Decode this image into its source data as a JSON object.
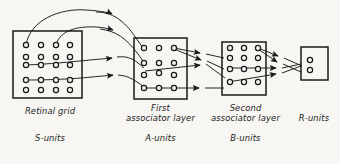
{
  "figure": {
    "type": "neural-network-architecture-diagram",
    "background_color": "#f7f6f3",
    "ink_color": "#1a1a1a",
    "layers": [
      {
        "id": "retinal-grid",
        "title": "Retinal grid",
        "unit_label": "S-units",
        "rows": 5,
        "cols": 4,
        "unit_count": 20,
        "box": {
          "x": 13,
          "y": 31,
          "w": 69,
          "h": 67
        }
      },
      {
        "id": "first-associator-layer",
        "title_line1": "First",
        "title_line2": "associator layer",
        "unit_label": "A-units",
        "rows": 4,
        "cols": 3,
        "unit_count": 12,
        "box": {
          "x": 134,
          "y": 38,
          "w": 53,
          "h": 61
        }
      },
      {
        "id": "second-associator-layer",
        "title_line1": "Second",
        "title_line2": "associator layer",
        "unit_label": "B-units",
        "rows": 4,
        "cols": 3,
        "unit_count": 12,
        "box": {
          "x": 222,
          "y": 42,
          "w": 44,
          "h": 53
        }
      },
      {
        "id": "r-units",
        "title": "R-units",
        "unit_label": "",
        "rows": 2,
        "cols": 1,
        "unit_count": 2,
        "box": {
          "x": 301,
          "y": 47,
          "w": 27,
          "h": 33
        }
      }
    ],
    "connection_groups": [
      {
        "from": "retinal-grid",
        "to": "first-associator-layer",
        "style": "curved-arc-and-straight",
        "count": 4
      },
      {
        "from": "first-associator-layer",
        "to": "second-associator-layer",
        "style": "crossing-straight",
        "count": 4
      },
      {
        "from": "second-associator-layer",
        "to": "r-units",
        "style": "converging-crossing",
        "count": 4
      }
    ],
    "arrow_marker": "filled-triangle"
  },
  "labels": {
    "retinal_grid_title": "Retinal grid",
    "s_units": "S-units",
    "first_assoc_line1": "First",
    "first_assoc_line2": "associator layer",
    "a_units": "A-units",
    "second_assoc_line1": "Second",
    "second_assoc_line2": "associator layer",
    "b_units": "B-units",
    "r_units_title": "R-units"
  }
}
